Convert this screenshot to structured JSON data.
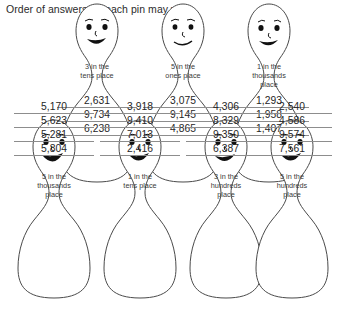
{
  "worksheet": {
    "instruction": "Order of answers on each pin may vary."
  },
  "rows": {
    "top": [
      {
        "label": "3 in the\ntens place",
        "label_lines": [
          "3 in the",
          "tens place"
        ],
        "answers": [
          "2,631",
          "9,734",
          "6,238"
        ]
      },
      {
        "label": "5 in the\nones place",
        "label_lines": [
          "5 in the",
          "ones place"
        ],
        "answers": [
          "3,075",
          "9,145",
          "4,865"
        ]
      },
      {
        "label": "1 in the\nthousands\nplace",
        "label_lines": [
          "1 in the",
          "thousands",
          "place"
        ],
        "answers": [
          "1,293",
          "1,958",
          "1,407"
        ]
      }
    ],
    "bottom": [
      {
        "label": "5 in the\nthousands\nplace",
        "label_lines": [
          "5 in the",
          "thousands",
          "place"
        ],
        "answers": [
          "5,170",
          "5,623",
          "5,281",
          "5,804"
        ]
      },
      {
        "label": "1 in the\ntens place",
        "label_lines": [
          "1 in the",
          "tens place"
        ],
        "answers": [
          "3,918",
          "9,410",
          "7,013",
          "2,416"
        ]
      },
      {
        "label": "3 in the\nhundreds\nplace",
        "label_lines": [
          "3 in the",
          "hundreds",
          "place"
        ],
        "answers": [
          "4,306",
          "8,329",
          "9,350",
          "6,387"
        ]
      },
      {
        "label": "5 in the\nhundreds\nplace",
        "label_lines": [
          "5 in the",
          "hundreds",
          "place"
        ],
        "answers": [
          "2,540",
          "4,586",
          "9,574",
          "7,561"
        ]
      }
    ]
  },
  "style": {
    "outline_color": "#4a4a4a",
    "rule_color": "#8d8d8d",
    "text_color": "#262626",
    "background": "#ffffff"
  }
}
